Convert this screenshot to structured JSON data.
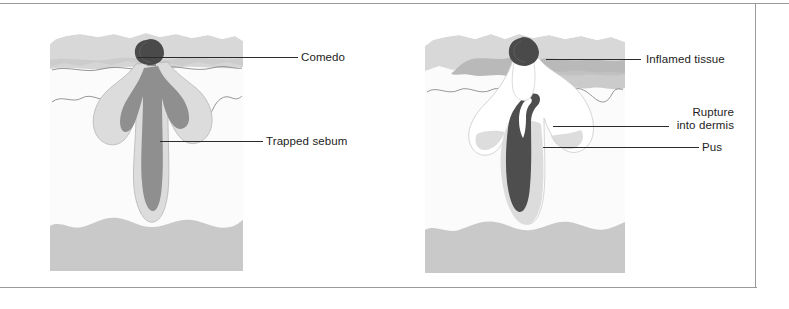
{
  "page": {
    "width": 789,
    "height": 309,
    "background": "#ffffff",
    "border_color": "#9a9a9a"
  },
  "palette": {
    "epidermis": "#d8d8d8",
    "epidermis_dark": "#c4c4c4",
    "dermis": "#fbfbfb",
    "subcutaneous": "#c9c9c9",
    "follicle_wall": "#dcdcdc",
    "sebum": "#8f8f8f",
    "comedo": "#4a4a4a",
    "inflamed": "#b9b9b9",
    "pus": "#ffffff",
    "outline": "#8a8a8a",
    "leader_line": "#2b2b2b",
    "text": "#1d1d1d"
  },
  "figures": [
    {
      "id": "comedo-figure",
      "name": "closed-comedo-diagram",
      "bounds": {
        "x": 50,
        "y": 30,
        "width": 193,
        "height": 241
      },
      "labels": [
        {
          "id": "comedo-label",
          "name": "label-comedo",
          "text": "Comedo",
          "x": 301,
          "y": 51,
          "leader": {
            "x": 138,
            "y": 57,
            "width": 160
          }
        },
        {
          "id": "trapped-sebum-label",
          "name": "label-trapped-sebum",
          "text": "Trapped sebum",
          "x": 266,
          "y": 135,
          "leader": {
            "x": 160,
            "y": 141,
            "width": 103
          }
        }
      ]
    },
    {
      "id": "inflamed-figure",
      "name": "ruptured-lesion-diagram",
      "bounds": {
        "x": 425,
        "y": 30,
        "width": 200,
        "height": 243
      },
      "labels": [
        {
          "id": "inflamed-tissue-label",
          "name": "label-inflamed-tissue",
          "text": "Inflamed tissue",
          "x": 646,
          "y": 53,
          "leader": {
            "x": 546,
            "y": 59,
            "width": 95
          }
        },
        {
          "id": "rupture-label",
          "name": "label-rupture-into-dermis",
          "text": "Rupture\ninto dermis",
          "x": 620,
          "y": 106,
          "leader": {
            "x": 553,
            "y": 126,
            "width": 116
          }
        },
        {
          "id": "pus-label",
          "name": "label-pus",
          "text": "Pus",
          "x": 702,
          "y": 141,
          "leader": {
            "x": 543,
            "y": 147,
            "width": 156
          }
        }
      ]
    }
  ]
}
